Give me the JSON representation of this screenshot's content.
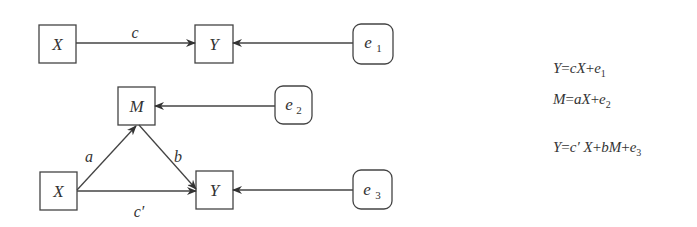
{
  "diagram": {
    "model1": {
      "x_label": "X",
      "y_label": "Y",
      "e_label": "e",
      "e_sub": "1",
      "path_label": "c"
    },
    "model2": {
      "x_label": "X",
      "m_label": "M",
      "y_label": "Y",
      "e2_label": "e",
      "e2_sub": "2",
      "e3_label": "e",
      "e3_sub": "3",
      "path_a": "a",
      "path_b": "b",
      "path_c_prime": "c′"
    }
  },
  "equations": [
    {
      "lhs": "Y",
      "rhs_parts": [
        "=",
        "c",
        "X",
        "+",
        "e",
        "1"
      ]
    },
    {
      "lhs": "M",
      "rhs_parts": [
        "=",
        "a",
        "X",
        "+",
        "e",
        "2"
      ]
    },
    {
      "lhs": "Y",
      "rhs_parts": [
        "=",
        "c′",
        " X",
        "+",
        "bM",
        "+",
        "e",
        "3"
      ]
    }
  ],
  "colors": {
    "stroke": "#444444",
    "text": "#333333",
    "background": "#ffffff"
  }
}
